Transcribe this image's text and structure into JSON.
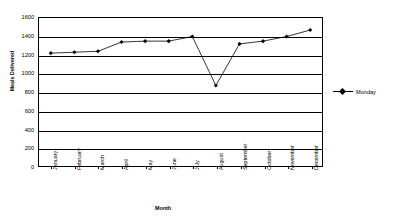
{
  "chart_data": {
    "type": "line",
    "title": "",
    "xlabel": "Month",
    "ylabel": "Meals Delivered",
    "categories": [
      "January",
      "February",
      "March",
      "April",
      "May",
      "June",
      "July",
      "August",
      "September",
      "October",
      "November",
      "December"
    ],
    "series": [
      {
        "name": "Monday",
        "values": [
          1220,
          1230,
          1240,
          1340,
          1350,
          1350,
          1400,
          870,
          1320,
          1350,
          1400,
          1470
        ]
      }
    ],
    "ylim": [
      0,
      1600
    ],
    "ytick_step": 200,
    "yticks": [
      1600,
      1400,
      1200,
      1000,
      800,
      600,
      400,
      200,
      0
    ],
    "grid": true,
    "grid_axis": "y",
    "legend_position": "right",
    "marker": "diamond",
    "line_color": "#000000",
    "marker_color": "#000000"
  },
  "legend": {
    "entries": [
      {
        "label": "Monday"
      }
    ]
  }
}
